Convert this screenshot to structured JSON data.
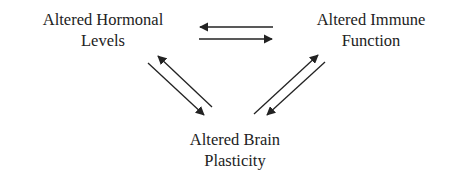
{
  "diagram": {
    "nodes": [
      {
        "id": "hormonal",
        "lines": [
          "Altered Hormonal",
          "Levels"
        ]
      },
      {
        "id": "immune",
        "lines": [
          "Altered Immune",
          "Function"
        ]
      },
      {
        "id": "brain",
        "lines": [
          "Altered Brain",
          "Plasticity"
        ]
      }
    ],
    "edges": [
      {
        "from": "immune",
        "to": "hormonal"
      },
      {
        "from": "hormonal",
        "to": "immune"
      },
      {
        "from": "brain",
        "to": "hormonal"
      },
      {
        "from": "hormonal",
        "to": "brain"
      },
      {
        "from": "brain",
        "to": "immune"
      },
      {
        "from": "immune",
        "to": "brain"
      }
    ],
    "colors": {
      "text": "#222222",
      "arrow": "#222222",
      "background": "#ffffff"
    }
  }
}
